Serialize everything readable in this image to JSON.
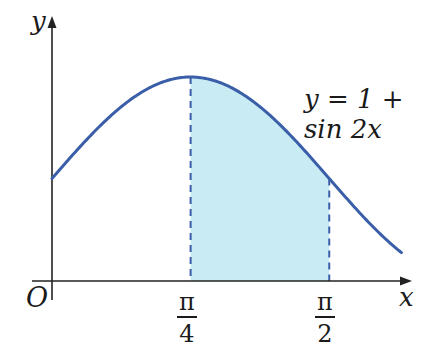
{
  "chart_data": {
    "type": "area",
    "title": "",
    "function_label": "y = 1 + sin 2x",
    "xlabel": "x",
    "ylabel": "y",
    "origin_label": "O",
    "x_ticks": [
      {
        "value": 0.7854,
        "numerator": "π",
        "denominator": "4"
      },
      {
        "value": 1.5708,
        "numerator": "π",
        "denominator": "2"
      }
    ],
    "curve": {
      "expression": "1 + sin(2x)",
      "x_range": [
        0,
        1.98
      ],
      "color": "#3a5ea8"
    },
    "shaded_region": {
      "x_from": 0.7854,
      "x_to": 1.5708,
      "fill": "#c9ecf4",
      "boundary_style": "dashed",
      "boundary_color": "#3a5ea8"
    },
    "key_points": [
      {
        "x": 0,
        "y": 1
      },
      {
        "x": 0.7854,
        "y": 2
      },
      {
        "x": 1.5708,
        "y": 1
      }
    ],
    "ylim": [
      0,
      2.1
    ],
    "grid": false,
    "legend": "none"
  }
}
